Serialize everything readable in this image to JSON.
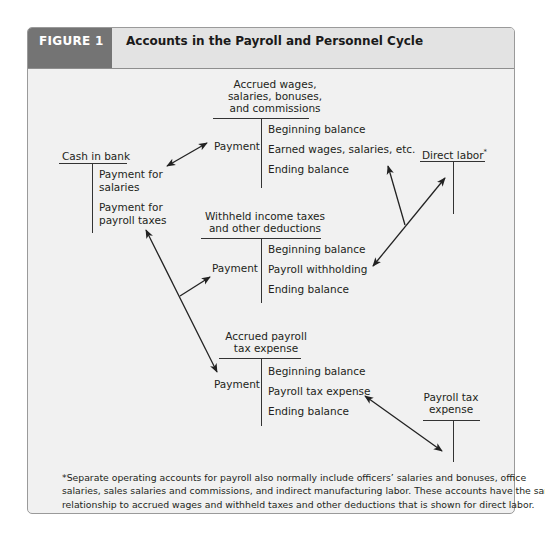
{
  "header": {
    "figure_label": "FIGURE 1",
    "title": "Accounts in the Payroll and Personnel Cycle",
    "label_bg": "#747474",
    "title_bg": "#e3e3e3"
  },
  "accounts": {
    "accrued_wages": {
      "title_lines": [
        "Accrued wages,",
        "salaries, bonuses,",
        "and commissions"
      ],
      "debit": [
        "Payment"
      ],
      "credit": [
        "Beginning balance",
        "Earned wages, salaries, etc.",
        "Ending balance"
      ]
    },
    "cash_in_bank": {
      "title": "Cash in bank",
      "debit": [],
      "credit": [
        "Payment for",
        "salaries",
        "Payment for",
        "payroll taxes"
      ]
    },
    "direct_labor": {
      "title": "Direct labor",
      "superscript": "*",
      "debit": [],
      "credit": []
    },
    "withheld_taxes": {
      "title_lines": [
        "Withheld income taxes",
        "and other deductions"
      ],
      "debit": [
        "Payment"
      ],
      "credit": [
        "Beginning balance",
        "Payroll withholding",
        "Ending balance"
      ]
    },
    "accrued_payroll_tax": {
      "title_lines": [
        "Accrued payroll",
        "tax expense"
      ],
      "debit": [
        "Payment"
      ],
      "credit": [
        "Beginning balance",
        "Payroll tax expense",
        "Ending balance"
      ]
    },
    "payroll_tax_expense": {
      "title_lines": [
        "Payroll tax",
        "expense"
      ],
      "debit": [],
      "credit": []
    }
  },
  "footnote": {
    "lines": [
      "*Separate operating accounts for payroll also normally include officers’ salaries and bonuses, office",
      "salaries, sales salaries and commissions, and indirect manufacturing labor. These accounts have the same",
      "relationship to accrued wages and withheld taxes and other deductions that is shown for direct labor."
    ]
  }
}
